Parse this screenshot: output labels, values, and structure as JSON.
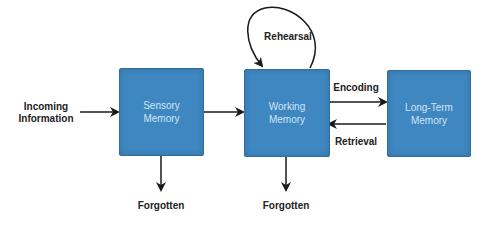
{
  "diagram": {
    "nodes": [
      {
        "id": "sensory",
        "label": "Sensory\nMemory"
      },
      {
        "id": "working",
        "label": "Working\nMemory"
      },
      {
        "id": "longterm",
        "label": "Long-Term\nMemory"
      }
    ],
    "labels": {
      "incoming": "Incoming\nInformation",
      "rehearsal": "Rehearsal",
      "encoding": "Encoding",
      "retrieval": "Retrieval",
      "forgotten_sensory": "Forgotten",
      "forgotten_working": "Forgotten"
    },
    "edges": [
      {
        "from": "incoming",
        "to": "sensory"
      },
      {
        "from": "sensory",
        "to": "working"
      },
      {
        "from": "working",
        "to": "working",
        "label": "Rehearsal"
      },
      {
        "from": "working",
        "to": "longterm",
        "label": "Encoding"
      },
      {
        "from": "longterm",
        "to": "working",
        "label": "Retrieval"
      },
      {
        "from": "sensory",
        "to": "forgotten",
        "label": "Forgotten"
      },
      {
        "from": "working",
        "to": "forgotten",
        "label": "Forgotten"
      }
    ],
    "colors": {
      "box": "#3f87c0",
      "box_text": "#cfe4f5",
      "arrow": "#1a1a1a"
    }
  }
}
